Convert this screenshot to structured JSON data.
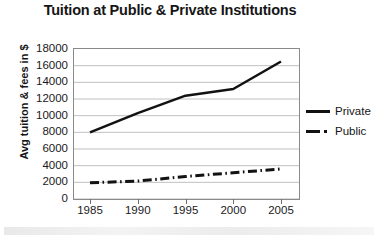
{
  "chart_data": {
    "type": "line",
    "title": "Tuition at Public & Private Institutions",
    "xlabel": "",
    "ylabel": "Avg tuition & fees in $",
    "x": [
      1985,
      1990,
      1995,
      2000,
      2005
    ],
    "xticklabels": [
      "1985",
      "1990",
      "1995",
      "2000",
      "2005"
    ],
    "yticklabels": [
      "18000",
      "16000",
      "14000",
      "12000",
      "10000",
      "8000",
      "6000",
      "4000",
      "2000",
      "0"
    ],
    "ylim": [
      0,
      18000
    ],
    "ytick_step": 2000,
    "grid": "horizontal",
    "legend_position": "right",
    "series": [
      {
        "name": "Private",
        "style": "solid",
        "color": "#121212",
        "values": [
          8000,
          10300,
          12400,
          13200,
          16500
        ]
      },
      {
        "name": "Public",
        "style": "dash-dot",
        "color": "#121212",
        "values": [
          1950,
          2150,
          2700,
          3150,
          3600
        ]
      }
    ]
  },
  "legend": {
    "items": [
      {
        "label": "Private",
        "style": "solid"
      },
      {
        "label": "Public",
        "style": "dash-dot"
      }
    ]
  }
}
